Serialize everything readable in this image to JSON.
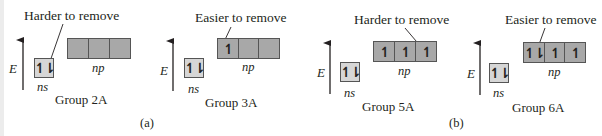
{
  "diagram": {
    "axis_label": "E",
    "panels": [
      {
        "label": "(a)"
      },
      {
        "label": "(b)"
      }
    ],
    "groups": [
      {
        "name": "Group 2A",
        "callout": "Harder to remove",
        "ns_label": "ns",
        "np_label": "np",
        "ns_electrons": "↿⇂",
        "np_electrons": [
          "",
          "",
          ""
        ]
      },
      {
        "name": "Group 3A",
        "callout": "Easier to remove",
        "ns_label": "ns",
        "np_label": "np",
        "ns_electrons": "↿⇂",
        "np_electrons": [
          "↿",
          "",
          ""
        ]
      },
      {
        "name": "Group 5A",
        "callout": "Harder to remove",
        "ns_label": "ns",
        "np_label": "np",
        "ns_electrons": "↿⇂",
        "np_electrons": [
          "↿",
          "↿",
          "↿"
        ]
      },
      {
        "name": "Group 6A",
        "callout": "Easier to remove",
        "ns_label": "ns",
        "np_label": "np",
        "ns_electrons": "↿⇂",
        "np_electrons": [
          "↿⇂",
          "↿",
          "↿"
        ]
      }
    ],
    "colors": {
      "ns_fill": "#d6d6d6",
      "np_fill": "#a8a8a8",
      "stroke": "#555555",
      "text": "#231f20"
    }
  }
}
